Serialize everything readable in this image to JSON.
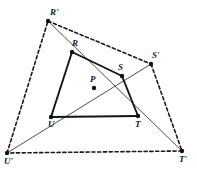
{
  "figure": {
    "width": 197,
    "height": 169,
    "background_color": "#ffffff",
    "stroke_color": "#1a1a1a",
    "point_color": "#111111"
  },
  "points": [
    {
      "id": "R_prime",
      "label": "R'",
      "x": 48,
      "y": 21,
      "label_x": 50,
      "label_y": 8,
      "kind": "outer-vertex"
    },
    {
      "id": "S_prime",
      "label": "S'",
      "x": 151,
      "y": 64,
      "label_x": 152,
      "label_y": 51,
      "kind": "outer-vertex"
    },
    {
      "id": "T_prime",
      "label": "T'",
      "x": 182,
      "y": 151,
      "label_x": 180,
      "label_y": 155,
      "kind": "outer-vertex"
    },
    {
      "id": "U_prime",
      "label": "U'",
      "x": 7,
      "y": 153,
      "label_x": 5,
      "label_y": 157,
      "kind": "outer-vertex"
    },
    {
      "id": "R",
      "label": "R",
      "x": 72,
      "y": 52,
      "label_x": 72,
      "label_y": 39,
      "kind": "inner-vertex"
    },
    {
      "id": "S",
      "label": "S",
      "x": 122,
      "y": 76,
      "label_x": 118,
      "label_y": 63,
      "kind": "inner-vertex"
    },
    {
      "id": "T",
      "label": "T",
      "x": 138,
      "y": 116,
      "label_x": 135,
      "label_y": 120,
      "kind": "inner-vertex"
    },
    {
      "id": "U",
      "label": "U",
      "x": 51,
      "y": 117,
      "label_x": 48,
      "label_y": 120,
      "kind": "inner-vertex"
    },
    {
      "id": "P",
      "label": "P",
      "x": 94,
      "y": 88,
      "label_x": 91,
      "label_y": 75,
      "kind": "intersection"
    }
  ],
  "segments": [
    {
      "id": "R-S",
      "from": "R",
      "to": "S",
      "style": "solid-thick"
    },
    {
      "id": "S-T",
      "from": "S",
      "to": "T",
      "style": "solid-thick"
    },
    {
      "id": "T-U",
      "from": "T",
      "to": "U",
      "style": "solid-thick"
    },
    {
      "id": "U-R",
      "from": "U",
      "to": "R",
      "style": "solid-thick"
    },
    {
      "id": "Rp-Sp",
      "from": "R_prime",
      "to": "S_prime",
      "style": "dashed"
    },
    {
      "id": "Sp-Tp",
      "from": "S_prime",
      "to": "T_prime",
      "style": "dashed"
    },
    {
      "id": "Tp-Up",
      "from": "T_prime",
      "to": "U_prime",
      "style": "dashed"
    },
    {
      "id": "Up-Rp",
      "from": "U_prime",
      "to": "R_prime",
      "style": "dashed"
    },
    {
      "id": "Rp-R-P-T-Tp",
      "from": "R_prime",
      "to": "T_prime",
      "style": "solid-thin",
      "through": [
        "R",
        "P",
        "T"
      ]
    },
    {
      "id": "Up-U-P-S-Sp",
      "from": "U_prime",
      "to": "S_prime",
      "style": "solid-thin",
      "through": [
        "U",
        "P",
        "S"
      ]
    }
  ]
}
